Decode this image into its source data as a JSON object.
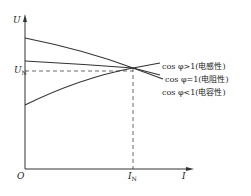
{
  "diagram": {
    "y_axis_label": "U",
    "x_axis_label": "I",
    "origin_label": "O",
    "un_label": {
      "main": "U",
      "sub": "N"
    },
    "in_label": {
      "main": "I",
      "sub": "N"
    },
    "curves": [
      {
        "id": "inductive",
        "label": "cos φ>1(电感性)",
        "shape": "decreasing, starts high"
      },
      {
        "id": "resistive",
        "label": "cos φ=1(电阻性)",
        "shape": "slightly decreasing"
      },
      {
        "id": "capacitive",
        "label": "cos φ<1(电容性)",
        "shape": "increasing, starts low"
      }
    ],
    "colors": {
      "line": "#333333",
      "dash": "#444444"
    }
  }
}
